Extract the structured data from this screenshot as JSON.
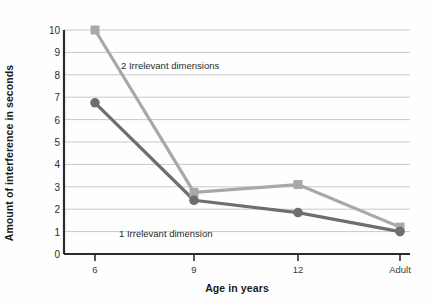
{
  "chart_data": {
    "type": "line",
    "title": "",
    "xlabel": "Age in years",
    "ylabel": "Amount of interference in seconds",
    "categories": [
      "6",
      "9",
      "12",
      "Adult"
    ],
    "ylim": [
      0,
      10
    ],
    "ytick_labels": [
      "0",
      "1",
      "2",
      "3",
      "4",
      "5",
      "6",
      "7",
      "8",
      "9",
      "10"
    ],
    "yticks": [
      0,
      1,
      2,
      3,
      4,
      5,
      6,
      7,
      8,
      9,
      10
    ],
    "grid": true,
    "legend_position": "inline-annotations",
    "series": [
      {
        "name": "2 Irrelevant dimensions",
        "marker": "square",
        "color": "#a8a8a8",
        "values": [
          10.0,
          2.75,
          3.1,
          1.2
        ]
      },
      {
        "name": "1 Irrelevant dimension",
        "marker": "circle",
        "color": "#6e6e6e",
        "values": [
          6.75,
          2.4,
          1.85,
          1.0
        ]
      }
    ],
    "annotations": [
      {
        "text": "2 Irrelevant dimensions",
        "x": 121,
        "y": 60
      },
      {
        "text": "1 Irrelevant dimension",
        "x": 119,
        "y": 228
      }
    ]
  },
  "colors": {
    "series_light": "#a8a8a8",
    "series_dark": "#6e6e6e",
    "axis": "#2b2b2b",
    "grid": "#c9c9c9",
    "background": "#fefefe"
  }
}
